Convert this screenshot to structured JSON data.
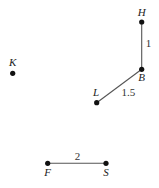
{
  "diagram": {
    "type": "graph",
    "nodes": [
      {
        "id": "H",
        "label": "H",
        "x": 141.7,
        "y": 22,
        "label_x": 141.7,
        "label_y": 16,
        "anchor": "middle"
      },
      {
        "id": "B",
        "label": "B",
        "x": 141.7,
        "y": 69.3,
        "label_x": 141.7,
        "label_y": 81,
        "anchor": "middle"
      },
      {
        "id": "L",
        "label": "L",
        "x": 96.7,
        "y": 102.7,
        "label_x": 96,
        "label_y": 96,
        "anchor": "middle"
      },
      {
        "id": "K",
        "label": "K",
        "x": 12.7,
        "y": 73.3,
        "label_x": 12.7,
        "label_y": 66,
        "anchor": "middle"
      },
      {
        "id": "F",
        "label": "F",
        "x": 47.7,
        "y": 163.3,
        "label_x": 47.7,
        "label_y": 176,
        "anchor": "middle"
      },
      {
        "id": "S",
        "label": "S",
        "x": 106,
        "y": 163.3,
        "label_x": 106,
        "label_y": 176,
        "anchor": "middle"
      }
    ],
    "edges": [
      {
        "from": "H",
        "to": "B",
        "weight": "1",
        "label_x": 148.5,
        "label_y": 47
      },
      {
        "from": "B",
        "to": "L",
        "weight": "1.5",
        "label_x": 128.3,
        "label_y": 96
      },
      {
        "from": "F",
        "to": "S",
        "weight": "2",
        "label_x": 77.5,
        "label_y": 160
      }
    ],
    "colors": {
      "node": "#111111",
      "edge": "#555555",
      "text": "#222222"
    }
  }
}
